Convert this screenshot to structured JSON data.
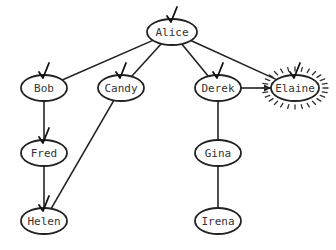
{
  "diagram": {
    "type": "tree",
    "colors": {
      "stroke": "#222222",
      "text": "#333333",
      "background": "#ffffff"
    },
    "nodes": [
      {
        "id": "alice",
        "label": "Alice",
        "x": 172,
        "y": 32,
        "rx": 25,
        "ry": 13,
        "checked": true,
        "highlighted": false
      },
      {
        "id": "bob",
        "label": "Bob",
        "x": 44,
        "y": 88,
        "rx": 23,
        "ry": 13,
        "checked": true,
        "highlighted": false
      },
      {
        "id": "candy",
        "label": "Candy",
        "x": 121,
        "y": 88,
        "rx": 23,
        "ry": 13,
        "checked": true,
        "highlighted": false
      },
      {
        "id": "derek",
        "label": "Derek",
        "x": 218,
        "y": 88,
        "rx": 23,
        "ry": 13,
        "checked": true,
        "highlighted": false
      },
      {
        "id": "elaine",
        "label": "Elaine",
        "x": 295,
        "y": 88,
        "rx": 24,
        "ry": 13,
        "checked": true,
        "highlighted": true
      },
      {
        "id": "fred",
        "label": "Fred",
        "x": 44,
        "y": 153,
        "rx": 23,
        "ry": 13,
        "checked": true,
        "highlighted": false
      },
      {
        "id": "gina",
        "label": "Gina",
        "x": 218,
        "y": 153,
        "rx": 23,
        "ry": 13,
        "checked": false,
        "highlighted": false
      },
      {
        "id": "helen",
        "label": "Helen",
        "x": 44,
        "y": 221,
        "rx": 23,
        "ry": 13,
        "checked": true,
        "highlighted": false
      },
      {
        "id": "irena",
        "label": "Irena",
        "x": 218,
        "y": 221,
        "rx": 23,
        "ry": 13,
        "checked": false,
        "highlighted": false
      }
    ],
    "edges": [
      {
        "from": "alice",
        "to": "bob"
      },
      {
        "from": "alice",
        "to": "candy"
      },
      {
        "from": "alice",
        "to": "derek"
      },
      {
        "from": "alice",
        "to": "elaine"
      },
      {
        "from": "bob",
        "to": "fred"
      },
      {
        "from": "fred",
        "to": "helen"
      },
      {
        "from": "candy",
        "to": "helen"
      },
      {
        "from": "derek",
        "to": "gina"
      },
      {
        "from": "gina",
        "to": "irena"
      },
      {
        "from": "derek",
        "to": "elaine",
        "arrow": true
      }
    ]
  }
}
